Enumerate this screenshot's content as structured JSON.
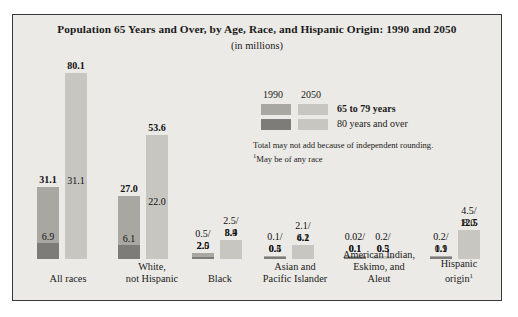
{
  "chart_data": {
    "type": "bar",
    "title": "Population 65 Years and Over, by Age, Race, and Hispanic Origin: 1990 and 2050",
    "subtitle": "(in millions)",
    "ylabel": "",
    "xlabel": "",
    "grid": false,
    "legend_position": "center",
    "legend": {
      "year_1990": "1990",
      "year_2050": "2050",
      "series_a": "65 to 79 years",
      "series_b": "80 years and over"
    },
    "notes": {
      "line1": "Total may not add because of independent rounding.",
      "line2_sup": "1",
      "line2": "May be of any race"
    },
    "colors": {
      "panel_bg": "#eceae6",
      "border": "#3a3a3a",
      "bar_1990_light": "#a9a7a2",
      "bar_1990_dark": "#7e7c78",
      "bar_2050_light": "#c8c6c1",
      "bar_2050_dark": "#a9a7a2"
    },
    "ylim": [
      0,
      80.1
    ],
    "categories": [
      "All races",
      "White, not Hispanic",
      "Black",
      "Asian and Pacific Islander",
      "American Indian, Eskimo, and Aleut",
      "Hispanic origin"
    ],
    "groups": [
      {
        "name": "All races",
        "label_line1": "All races",
        "label_line2": "",
        "superscript": "",
        "bar_1990": {
          "total": 31.1,
          "total_label": "31.1",
          "over80": 6.9,
          "over80_label": "6.9",
          "age65to79": 24.2,
          "split_label": ""
        },
        "bar_2050": {
          "total": 80.1,
          "total_label": "80.1",
          "over80": 31.1,
          "over80_label": "31.1",
          "age65to79": 49.0,
          "split_label": ""
        }
      },
      {
        "name": "White, not Hispanic",
        "label_line1": "White,",
        "label_line2": "not Hispanic",
        "superscript": "",
        "bar_1990": {
          "total": 27.0,
          "total_label": "27.0",
          "over80": 6.1,
          "over80_label": "6.1",
          "age65to79": 20.9,
          "split_label": ""
        },
        "bar_2050": {
          "total": 53.6,
          "total_label": "53.6",
          "over80": 22.0,
          "over80_label": "22.0",
          "age65to79": 31.6,
          "split_label": ""
        }
      },
      {
        "name": "Black",
        "label_line1": "Black",
        "label_line2": "",
        "superscript": "",
        "bar_1990": {
          "total": 2.5,
          "total_label": "2.5",
          "over80": 0.5,
          "over80_label": "",
          "age65to79": 2.0,
          "split_label": "0.5/\n2.0"
        },
        "bar_2050": {
          "total": 8.4,
          "total_label": "8.4",
          "over80": 2.5,
          "over80_label": "",
          "age65to79": 5.9,
          "split_label": "2.5/\n5.9"
        }
      },
      {
        "name": "Asian and Pacific Islander",
        "label_line1": "Asian and",
        "label_line2": "Pacific Islander",
        "superscript": "",
        "bar_1990": {
          "total": 0.5,
          "total_label": "0.5",
          "over80": 0.1,
          "over80_label": "",
          "age65to79": 0.4,
          "split_label": "0.1/\n0.4"
        },
        "bar_2050": {
          "total": 6.2,
          "total_label": "6.2",
          "over80": 2.1,
          "over80_label": "",
          "age65to79": 4.1,
          "split_label": "2.1/\n4.1"
        }
      },
      {
        "name": "American Indian, Eskimo, and Aleut",
        "label_line1": "American Indian,",
        "label_line2": "Eskimo, and Aleut",
        "superscript": "",
        "bar_1990": {
          "total": 0.1,
          "total_label": "0.1",
          "over80": 0.02,
          "over80_label": "",
          "age65to79": 0.1,
          "split_label": "0.02/\n0.1"
        },
        "bar_2050": {
          "total": 0.5,
          "total_label": "0.5",
          "over80": 0.2,
          "over80_label": "",
          "age65to79": 0.3,
          "split_label": "0.2/\n0.3"
        }
      },
      {
        "name": "Hispanic origin",
        "label_line1": "Hispanic",
        "label_line2": "origin",
        "superscript": "1",
        "bar_1990": {
          "total": 1.1,
          "total_label": "1.1",
          "over80": 0.2,
          "over80_label": "",
          "age65to79": 0.9,
          "split_label": "0.2/\n0.9"
        },
        "bar_2050": {
          "total": 12.5,
          "total_label": "12.5",
          "over80": 4.5,
          "over80_label": "",
          "age65to79": 8.0,
          "split_label": "4.5/\n8.0"
        }
      }
    ]
  }
}
